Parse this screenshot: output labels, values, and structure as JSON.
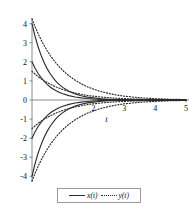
{
  "chart_data": {
    "type": "line",
    "title": "",
    "subtitle": "",
    "xlabel": "t",
    "ylabel": "",
    "xlim": [
      0,
      5.1
    ],
    "ylim": [
      -4.3,
      4.3
    ],
    "grid": false,
    "legend_position": "bottom-center",
    "x_ticks": [
      2,
      3,
      4,
      5
    ],
    "x_tick_labels": [
      "2",
      "3",
      "4",
      "5"
    ],
    "y_ticks": [
      -4,
      -3,
      -2,
      -1,
      0,
      1,
      2,
      3,
      4
    ],
    "y_tick_labels": [
      "-4",
      "-3",
      "-2",
      "-1",
      "0",
      "1",
      "2",
      "3",
      "4"
    ],
    "x": [
      0,
      0.1,
      0.2,
      0.3,
      0.4,
      0.5,
      0.6,
      0.7,
      0.8,
      0.9,
      1.0,
      1.2,
      1.4,
      1.6,
      1.8,
      2.0,
      2.25,
      2.5,
      2.75,
      3.0,
      3.5,
      4.0,
      4.5,
      5.0
    ],
    "series": [
      {
        "name": "x(t)",
        "label": "x(t)",
        "style": "solid",
        "color": "#2b2b2b",
        "start_value": 4.0,
        "values": [
          4.0,
          3.33,
          2.78,
          2.32,
          1.94,
          1.62,
          1.35,
          1.13,
          0.94,
          0.79,
          0.66,
          0.46,
          0.32,
          0.22,
          0.15,
          0.11,
          0.068,
          0.043,
          0.027,
          0.017,
          0.0067,
          0.0027,
          0.0011,
          0.0004
        ]
      },
      {
        "name": "x(t)",
        "label": "x(t)",
        "style": "solid",
        "color": "#2b2b2b",
        "start_value": 2.0,
        "values": [
          2.0,
          1.67,
          1.39,
          1.16,
          0.97,
          0.81,
          0.67,
          0.56,
          0.47,
          0.39,
          0.33,
          0.23,
          0.16,
          0.11,
          0.077,
          0.053,
          0.034,
          0.022,
          0.014,
          0.0086,
          0.0033,
          0.0013,
          0.0005,
          0.0002
        ]
      },
      {
        "name": "x(t)",
        "label": "x(t)",
        "style": "solid",
        "color": "#2b2b2b",
        "start_value": -2.0,
        "values": [
          -2.0,
          -1.67,
          -1.39,
          -1.16,
          -0.97,
          -0.81,
          -0.67,
          -0.56,
          -0.47,
          -0.39,
          -0.33,
          -0.23,
          -0.16,
          -0.11,
          -0.077,
          -0.053,
          -0.034,
          -0.022,
          -0.014,
          -0.0086,
          -0.0033,
          -0.0013,
          -0.0005,
          -0.0002
        ]
      },
      {
        "name": "x(t)",
        "label": "x(t)",
        "style": "solid",
        "color": "#2b2b2b",
        "start_value": -4.0,
        "values": [
          -4.0,
          -3.33,
          -2.78,
          -2.32,
          -1.94,
          -1.62,
          -1.35,
          -1.13,
          -0.94,
          -0.79,
          -0.66,
          -0.46,
          -0.32,
          -0.22,
          -0.15,
          -0.11,
          -0.068,
          -0.043,
          -0.027,
          -0.017,
          -0.0067,
          -0.0027,
          -0.0011,
          -0.0004
        ]
      },
      {
        "name": "y(t)",
        "label": "y(t)",
        "style": "dotted",
        "color": "#2b2b2b",
        "start_value": 4.25,
        "values": [
          4.25,
          3.84,
          3.47,
          3.14,
          2.84,
          2.57,
          2.32,
          2.1,
          1.9,
          1.72,
          1.55,
          1.27,
          1.04,
          0.85,
          0.69,
          0.57,
          0.44,
          0.34,
          0.26,
          0.2,
          0.12,
          0.07,
          0.04,
          0.024
        ]
      },
      {
        "name": "y(t)",
        "label": "y(t)",
        "style": "dotted",
        "color": "#2b2b2b",
        "start_value": 1.5,
        "values": [
          1.5,
          1.36,
          1.22,
          1.11,
          1.0,
          0.91,
          0.82,
          0.74,
          0.67,
          0.61,
          0.55,
          0.45,
          0.37,
          0.3,
          0.24,
          0.2,
          0.155,
          0.12,
          0.093,
          0.072,
          0.043,
          0.026,
          0.015,
          0.009
        ]
      },
      {
        "name": "y(t)",
        "label": "y(t)",
        "style": "dotted",
        "color": "#2b2b2b",
        "start_value": -1.5,
        "values": [
          -1.5,
          -1.36,
          -1.22,
          -1.11,
          -1.0,
          -0.91,
          -0.82,
          -0.74,
          -0.67,
          -0.61,
          -0.55,
          -0.45,
          -0.37,
          -0.3,
          -0.24,
          -0.2,
          -0.155,
          -0.12,
          -0.093,
          -0.072,
          -0.043,
          -0.026,
          -0.015,
          -0.009
        ]
      },
      {
        "name": "y(t)",
        "label": "y(t)",
        "style": "dotted",
        "color": "#2b2b2b",
        "start_value": -4.25,
        "values": [
          -4.25,
          -3.84,
          -3.47,
          -3.14,
          -2.84,
          -2.57,
          -2.32,
          -2.1,
          -1.9,
          -1.72,
          -1.55,
          -1.27,
          -1.04,
          -0.85,
          -0.69,
          -0.57,
          -0.44,
          -0.34,
          -0.26,
          -0.2,
          -0.12,
          -0.07,
          -0.04,
          -0.024
        ]
      }
    ],
    "legend": [
      {
        "label": "x(t)",
        "style": "solid"
      },
      {
        "label": "y(t)",
        "style": "dotted"
      }
    ],
    "annotations": []
  },
  "legend": {
    "entry_x_label": "x(t)",
    "entry_y_label": "y(t)"
  },
  "axes": {
    "x_axis_label": "t"
  },
  "colors": {
    "curve": "#2b2b2b",
    "axis": "#8a8a8a",
    "tick_text": "#111111",
    "legend_border": "#9a9a9a",
    "background": "#ffffff"
  }
}
